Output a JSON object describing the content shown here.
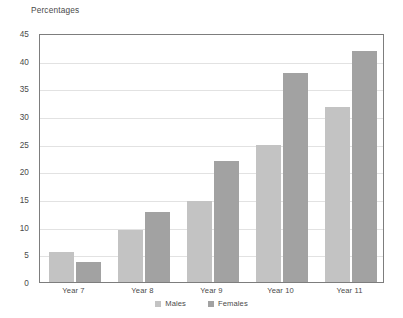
{
  "chart_data": {
    "type": "bar",
    "title": "Percentages",
    "xlabel": "",
    "ylabel": "Percentages",
    "categories": [
      "Year 7",
      "Year 8",
      "Year 9",
      "Year 10",
      "Year 11"
    ],
    "series": [
      {
        "name": "Males",
        "color": "#c3c3c3",
        "values": [
          5.4,
          9.4,
          14.6,
          24.7,
          31.6
        ]
      },
      {
        "name": "Females",
        "color": "#a2a2a2",
        "values": [
          3.6,
          12.6,
          21.8,
          37.7,
          41.8
        ]
      }
    ],
    "ylim": [
      0,
      45
    ],
    "ytick_labels": [
      "0",
      "5",
      "10",
      "15",
      "20",
      "25",
      "30",
      "35",
      "40",
      "45"
    ],
    "ytick_values": [
      0,
      5,
      10,
      15,
      20,
      25,
      30,
      35,
      40,
      45
    ],
    "grid": true,
    "legend_position": "bottom"
  }
}
